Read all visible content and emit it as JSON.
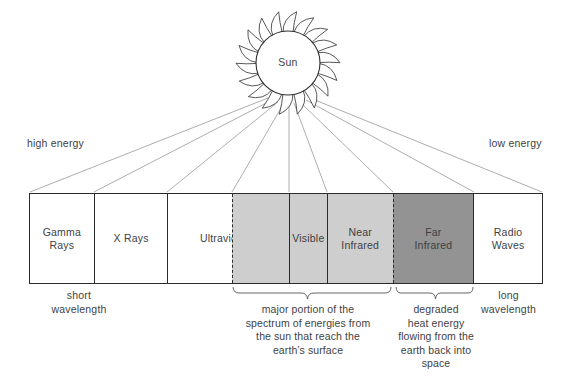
{
  "diagram": {
    "background_color": "#ffffff",
    "line_color": "#2b2b2b",
    "text_color": "#3f3f3f"
  },
  "sun": {
    "label": "Sun",
    "ray_count": 18,
    "center_x": 288,
    "center_y": 63,
    "core_radius": 32
  },
  "energy": {
    "high_label": "high energy",
    "low_label": "low energy"
  },
  "wavelength": {
    "short_label": "short\nwavelength",
    "short_line1": "short",
    "short_line2": "wavelength",
    "long_line1": "long",
    "long_line2": "wavelength"
  },
  "spectrum": {
    "bands": [
      {
        "id": "gamma-rays",
        "line1": "Gamma",
        "line2": "Rays",
        "fill": "#ffffff",
        "start_px": 29,
        "end_px": 93,
        "left_border": "solid"
      },
      {
        "id": "x-rays",
        "line1": "X Rays",
        "line2": "",
        "fill": "#ffffff",
        "start_px": 93,
        "end_px": 167,
        "left_border": "solid"
      },
      {
        "id": "ultraviolet",
        "line1": "Ultraviolet",
        "line2": "",
        "fill": "#ffffff",
        "start_px": 167,
        "end_px": 232,
        "left_border": "solid"
      },
      {
        "id": "uv-absorbed",
        "line1": "",
        "line2": "",
        "fill": "#cecece",
        "start_px": 232,
        "end_px": 289,
        "left_border": "dashed"
      },
      {
        "id": "visible",
        "line1": "Visible",
        "line2": "",
        "fill": "#cecece",
        "start_px": 289,
        "end_px": 327,
        "left_border": "solid"
      },
      {
        "id": "near-infrared",
        "line1": "Near",
        "line2": "Infrared",
        "fill": "#cecece",
        "start_px": 327,
        "end_px": 393,
        "left_border": "solid"
      },
      {
        "id": "far-infrared",
        "line1": "Far",
        "line2": "Infrared",
        "fill": "#939393",
        "start_px": 393,
        "end_px": 474,
        "left_border": "dashed"
      },
      {
        "id": "radio-waves",
        "line1": "Radio",
        "line2": "Waves",
        "fill": "#ffffff",
        "start_px": 474,
        "end_px": 543,
        "left_border": "solid"
      }
    ],
    "bar_left": 29,
    "bar_right": 543,
    "bar_top": 193,
    "bar_bottom": 284,
    "light_gray": "#cecece",
    "dark_gray": "#939393"
  },
  "brackets": [
    {
      "id": "major-portion",
      "start_px": 232,
      "end_px": 391,
      "caption": "major portion of the spectrum of energies from the sun that reach the earth's surface",
      "lines": [
        "major portion of the",
        "spectrum of energies from",
        "the sun that reach the",
        "earth’s surface"
      ]
    },
    {
      "id": "degraded-heat",
      "start_px": 395,
      "end_px": 474,
      "caption": "degraded heat energy flowing from the earth back into space",
      "lines": [
        "degraded",
        "heat energy",
        "flowing from the",
        "earth back into",
        "space"
      ]
    }
  ],
  "rays": {
    "description": "thin lines radiating from the sun down to the spectrum band boundaries",
    "target_x": [
      29,
      93,
      167,
      232,
      289,
      327,
      393,
      474,
      543
    ]
  }
}
